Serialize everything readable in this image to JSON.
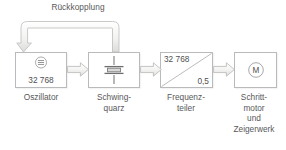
{
  "diagram": {
    "title_text": "Rückkopplung",
    "background_color": "#ffffff",
    "line_color": "#b9babb",
    "text_color": "#58585a",
    "feedback": {
      "label": "Rückkopplung",
      "icon": "feedback-loop-arrow"
    },
    "blocks": [
      {
        "id": "oszillator",
        "caption_line1": "Oszillator",
        "caption_line2": "",
        "icon": "oscillator-symbol",
        "value": "32 768"
      },
      {
        "id": "schwingquarz",
        "caption_line1": "Schwing-",
        "caption_line2": "quarz",
        "icon": "quartz-crystal-symbol",
        "value": ""
      },
      {
        "id": "frequenzteiler",
        "caption_line1": "Frequenz-",
        "caption_line2": "teiler",
        "icon": "divider-diagonal",
        "value_top": "32 768",
        "value_bottom": "0,5"
      },
      {
        "id": "schrittmotor",
        "caption_line1": "Schritt-",
        "caption_line2": "motor",
        "caption_line3": "und",
        "caption_line4": "Zeigerwerk",
        "icon": "motor-symbol",
        "motor_letter": "M"
      }
    ],
    "connectors": [
      {
        "id": "conn-osz-quarz",
        "icon": "right-block-arrow-icon"
      },
      {
        "id": "conn-quarz-freq",
        "icon": "right-block-arrow-icon"
      },
      {
        "id": "conn-freq-motor",
        "icon": "right-block-arrow-icon"
      }
    ]
  }
}
